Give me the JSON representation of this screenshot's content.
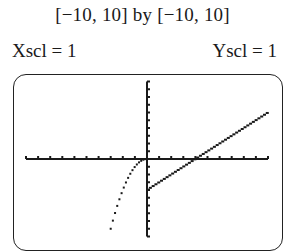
{
  "header": {
    "window_text": "[−10, 10] by [−10, 10]",
    "xscl_text": "Xscl = 1",
    "yscl_text": "Yscl = 1"
  },
  "colors": {
    "ink": "#1a1a1a",
    "background": "#ffffff"
  },
  "chart_data": {
    "type": "scatter",
    "title": "[−10, 10] by [−10, 10]",
    "xlabel": "",
    "ylabel": "",
    "xlim": [
      -10,
      10
    ],
    "ylim": [
      -10,
      10
    ],
    "xscl": 1,
    "yscl": 1,
    "grid": false,
    "legend": null,
    "annotations": [
      "Xscl = 1",
      "Yscl = 1"
    ],
    "series": [
      {
        "name": "left branch (x < 0)",
        "formula": "y = -x^2",
        "x": [
          -3.0,
          -2.75,
          -2.5,
          -2.25,
          -2.0,
          -1.75,
          -1.5,
          -1.25,
          -1.0,
          -0.75,
          -0.5,
          -0.25,
          0.0
        ],
        "values": [
          -9.0,
          -7.56,
          -6.25,
          -5.06,
          -4.0,
          -3.06,
          -2.25,
          -1.56,
          -1.0,
          -0.56,
          -0.25,
          -0.06,
          0.0
        ]
      },
      {
        "name": "right branch (x ≥ 0)",
        "formula": "y = x - 4",
        "x": [
          0,
          1,
          2,
          3,
          4,
          5,
          6,
          7,
          8,
          9,
          10
        ],
        "values": [
          -4,
          -3,
          -2,
          -1,
          0,
          1,
          2,
          3,
          4,
          5,
          6
        ]
      }
    ]
  }
}
